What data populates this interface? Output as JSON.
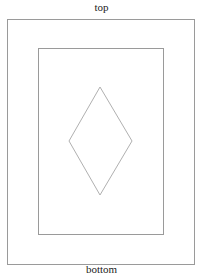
{
  "labels": {
    "top": "top",
    "bottom": "bottom"
  },
  "shapes": {
    "outer_rect": {
      "x": 7,
      "y": 19,
      "width": 187,
      "height": 245,
      "stroke": "#9a9a9a"
    },
    "inner_rect": {
      "x": 38,
      "y": 48,
      "width": 125,
      "height": 186,
      "stroke": "#9a9a9a"
    },
    "diamond": {
      "points": "100,87 132,141 100,195 69,141",
      "stroke": "#b0b0b0"
    }
  }
}
